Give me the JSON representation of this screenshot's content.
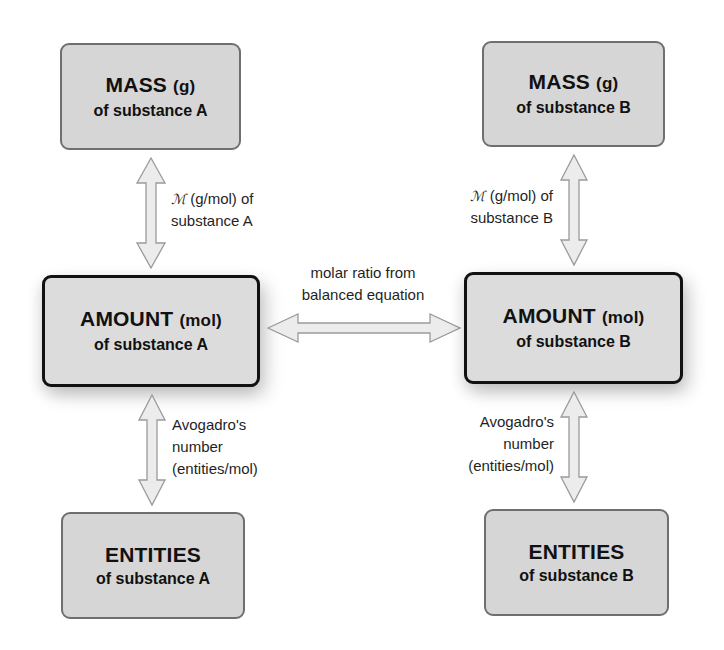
{
  "diagram": {
    "substance_a": {
      "mass": {
        "title": "MASS",
        "unit": "(g)",
        "subtitle": "of substance A"
      },
      "amount": {
        "title": "AMOUNT",
        "unit": "(mol)",
        "subtitle": "of substance A"
      },
      "entities": {
        "title": "ENTITIES",
        "unit": "",
        "subtitle": "of substance A"
      },
      "mass_to_amount_label": {
        "symbol": "ℳ",
        "line1": " (g/mol) of",
        "line2": "substance A"
      },
      "amount_to_entities_label": {
        "line1": "Avogadro's",
        "line2": "number",
        "line3": "(entities/mol)"
      }
    },
    "substance_b": {
      "mass": {
        "title": "MASS",
        "unit": "(g)",
        "subtitle": "of substance B"
      },
      "amount": {
        "title": "AMOUNT",
        "unit": "(mol)",
        "subtitle": "of substance B"
      },
      "entities": {
        "title": "ENTITIES",
        "unit": "",
        "subtitle": "of substance B"
      },
      "mass_to_amount_label": {
        "symbol": "ℳ",
        "line1": " (g/mol) of",
        "line2": "substance B"
      },
      "amount_to_entities_label": {
        "line1": "Avogadro's",
        "line2": "number",
        "line3": "(entities/mol)"
      }
    },
    "cross_link_label": {
      "line1": "molar ratio from",
      "line2": "balanced equation"
    },
    "colors": {
      "box_fill": "#d6d6d6",
      "core_box_fill": "#dcdcdc",
      "core_box_border": "#111111",
      "outer_box_border": "#6f6f6f",
      "arrow_fill": "#ececec",
      "arrow_stroke": "#9a9a9a"
    }
  }
}
